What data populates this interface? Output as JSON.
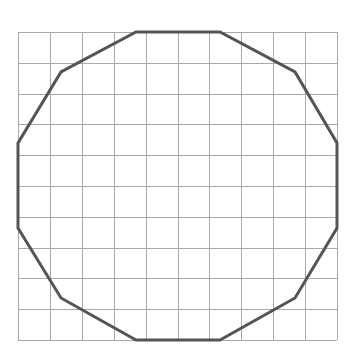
{
  "figure": {
    "grid": {
      "columns": 10,
      "rows": 10,
      "origin_px": [
        18,
        32
      ],
      "size_px": [
        319,
        308
      ],
      "line_color": "#a9a9a9",
      "line_width": 1
    },
    "polygon": {
      "name": "dodecagon",
      "sides": 12,
      "stroke_color": "#555555",
      "stroke_width": 3,
      "fill": "none",
      "vertices_px": [
        [
          136,
          32
        ],
        [
          220,
          32
        ],
        [
          295,
          72
        ],
        [
          337,
          143
        ],
        [
          337,
          228
        ],
        [
          295,
          298
        ],
        [
          220,
          340
        ],
        [
          136,
          340
        ],
        [
          61,
          298
        ],
        [
          18,
          228
        ],
        [
          18,
          143
        ],
        [
          61,
          72
        ]
      ]
    },
    "background": "#ffffff"
  }
}
